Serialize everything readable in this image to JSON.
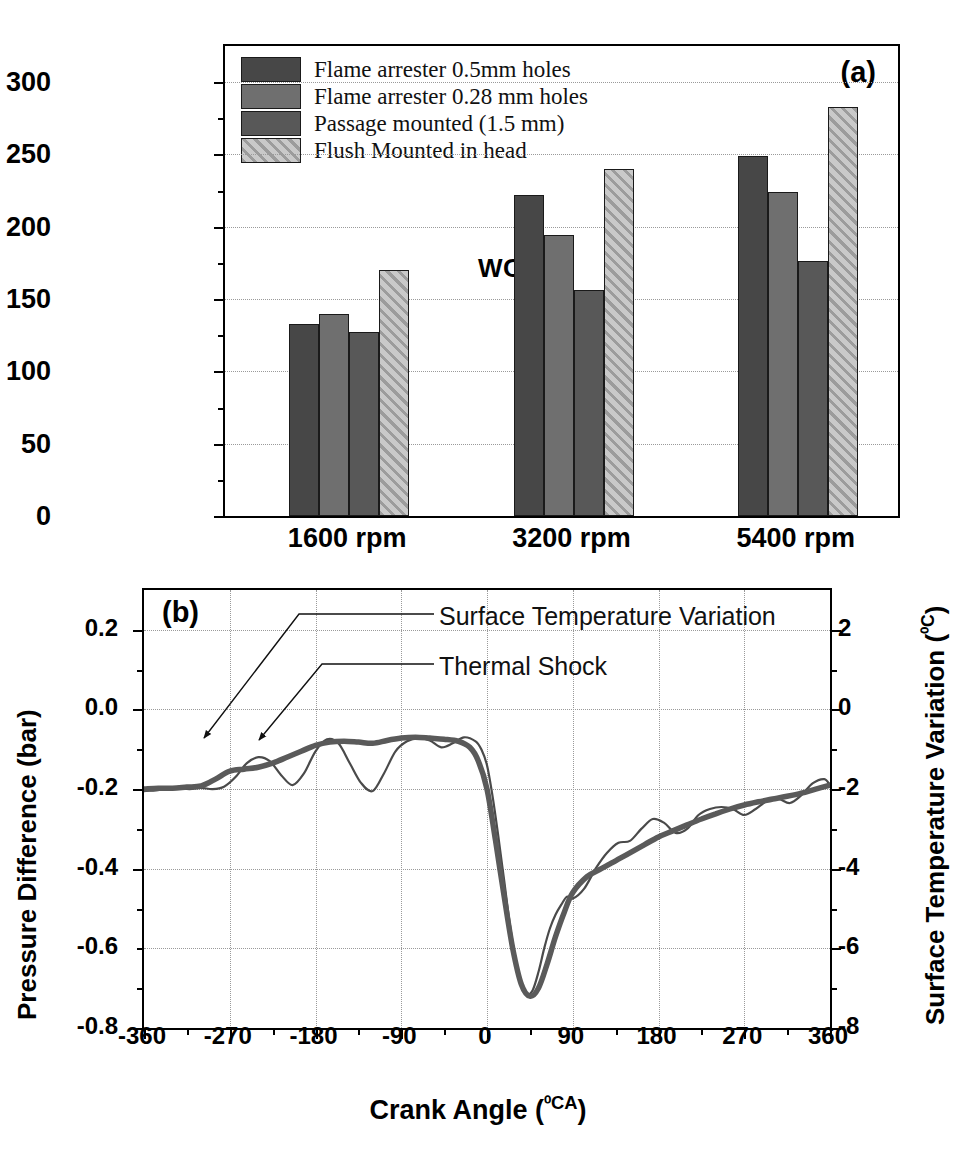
{
  "figure": {
    "panel_a_tag": "(a)",
    "panel_b_tag": "(b)",
    "annotation_wot": "WOT"
  },
  "chart_data": [
    {
      "type": "bar",
      "panel": "(a)",
      "title": "",
      "xlabel": "",
      "ylabel": "DiaphragmTempeature (0C)",
      "ylabel_plain": "DiaphragmTempeature",
      "ylabel_unit": "⁰C",
      "categories": [
        "1600 rpm",
        "3200 rpm",
        "5400 rpm"
      ],
      "ylim": [
        0,
        325
      ],
      "yticks": [
        0,
        50,
        100,
        150,
        200,
        250,
        300
      ],
      "ytick_labels": [
        "0",
        "50",
        "100",
        "150",
        "200",
        "250",
        "300"
      ],
      "grid": true,
      "legend_position": "upper-left-inside",
      "annotation": "WOT",
      "series": [
        {
          "name": "Flame arrester 0.5mm holes",
          "fill": "solid-dark",
          "color": "#474747",
          "values": [
            133,
            222,
            249
          ]
        },
        {
          "name": "Flame arrester 0.28 mm holes",
          "fill": "solid-light-gray",
          "color": "#6f6f6f",
          "values": [
            140,
            194,
            224
          ]
        },
        {
          "name": "Passage mounted (1.5 mm)",
          "fill": "solid-mid-gray",
          "color": "#585858",
          "values": [
            127,
            156,
            176
          ]
        },
        {
          "name": "Flush Mounted in head",
          "fill": "diagonal-hatch",
          "color": "#c9c9c9",
          "values": [
            170,
            240,
            283
          ]
        }
      ]
    },
    {
      "type": "line",
      "panel": "(b)",
      "title": "",
      "xlabel": "Crank Angle (0CA)",
      "xlabel_plain": "Crank Angle",
      "xlabel_unit": "⁰CA",
      "ylabel": "Pressure Difference (bar)",
      "ylabel_right": "Surface Temperature Variation (0C)",
      "ylabel_right_plain": "Surface Temperature Variation",
      "ylabel_right_unit": "⁰C",
      "xlim": [
        -360,
        360
      ],
      "xticks": [
        -360,
        -270,
        -180,
        -90,
        0,
        90,
        180,
        270,
        360
      ],
      "xtick_labels": [
        "-360",
        "-270",
        "-180",
        "-90",
        "0",
        "90",
        "180",
        "270",
        "360"
      ],
      "ylim": [
        -0.8,
        0.3
      ],
      "yticks": [
        0.2,
        0.0,
        -0.2,
        -0.4,
        -0.6,
        -0.8
      ],
      "ytick_labels": [
        "0.2",
        "0.0",
        "-0.2",
        "-0.4",
        "-0.6",
        "-0.8"
      ],
      "ylim_right": [
        -8,
        3
      ],
      "yticks_right": [
        2,
        0,
        -2,
        -4,
        -6,
        -8
      ],
      "ytick_labels_right": [
        "2",
        "0",
        "-2",
        "-4",
        "-6",
        "-8"
      ],
      "grid": true,
      "legend_position": "annotated-leader-lines",
      "series": [
        {
          "name": "Surface Temperature Variation",
          "style": "thin",
          "axis": "right",
          "color": "#4a4a4a",
          "x": [
            -360,
            -348,
            -336,
            -324,
            -312,
            -300,
            -288,
            -276,
            -264,
            -252,
            -240,
            -228,
            -216,
            -204,
            -192,
            -180,
            -168,
            -156,
            -144,
            -132,
            -120,
            -108,
            -96,
            -84,
            -72,
            -60,
            -48,
            -36,
            -24,
            -12,
            -6,
            0,
            6,
            12,
            18,
            24,
            30,
            36,
            42,
            48,
            54,
            60,
            66,
            72,
            78,
            84,
            90,
            102,
            114,
            126,
            138,
            150,
            162,
            174,
            186,
            198,
            210,
            222,
            234,
            246,
            258,
            270,
            282,
            294,
            306,
            318,
            330,
            342,
            354,
            360
          ],
          "y": [
            -0.205,
            -0.203,
            -0.2,
            -0.198,
            -0.2,
            -0.197,
            -0.2,
            -0.194,
            -0.17,
            -0.135,
            -0.12,
            -0.13,
            -0.165,
            -0.19,
            -0.16,
            -0.105,
            -0.075,
            -0.085,
            -0.135,
            -0.185,
            -0.205,
            -0.16,
            -0.105,
            -0.08,
            -0.072,
            -0.078,
            -0.095,
            -0.085,
            -0.07,
            -0.08,
            -0.1,
            -0.14,
            -0.22,
            -0.32,
            -0.43,
            -0.54,
            -0.63,
            -0.69,
            -0.715,
            -0.705,
            -0.66,
            -0.6,
            -0.55,
            -0.515,
            -0.49,
            -0.47,
            -0.475,
            -0.45,
            -0.4,
            -0.36,
            -0.335,
            -0.33,
            -0.3,
            -0.275,
            -0.285,
            -0.31,
            -0.3,
            -0.265,
            -0.25,
            -0.245,
            -0.25,
            -0.265,
            -0.25,
            -0.23,
            -0.225,
            -0.235,
            -0.215,
            -0.185,
            -0.175,
            -0.19
          ]
        },
        {
          "name": "Thermal Shock",
          "style": "thick",
          "axis": "left",
          "color": "#5a5a5a",
          "x": [
            -360,
            -345,
            -330,
            -315,
            -300,
            -285,
            -270,
            -255,
            -240,
            -225,
            -210,
            -195,
            -180,
            -165,
            -150,
            -135,
            -120,
            -105,
            -90,
            -75,
            -60,
            -45,
            -30,
            -18,
            -9,
            0,
            9,
            18,
            27,
            36,
            45,
            54,
            63,
            72,
            81,
            90,
            105,
            120,
            135,
            150,
            165,
            180,
            195,
            210,
            225,
            240,
            255,
            270,
            285,
            300,
            315,
            330,
            345,
            360
          ],
          "y": [
            -0.2,
            -0.198,
            -0.198,
            -0.195,
            -0.192,
            -0.175,
            -0.155,
            -0.15,
            -0.145,
            -0.135,
            -0.12,
            -0.105,
            -0.09,
            -0.082,
            -0.08,
            -0.082,
            -0.085,
            -0.078,
            -0.072,
            -0.07,
            -0.072,
            -0.075,
            -0.08,
            -0.095,
            -0.13,
            -0.2,
            -0.33,
            -0.47,
            -0.6,
            -0.69,
            -0.72,
            -0.7,
            -0.64,
            -0.57,
            -0.51,
            -0.46,
            -0.42,
            -0.4,
            -0.38,
            -0.36,
            -0.34,
            -0.32,
            -0.305,
            -0.29,
            -0.275,
            -0.262,
            -0.25,
            -0.24,
            -0.232,
            -0.225,
            -0.218,
            -0.21,
            -0.2,
            -0.19
          ]
        }
      ]
    }
  ]
}
